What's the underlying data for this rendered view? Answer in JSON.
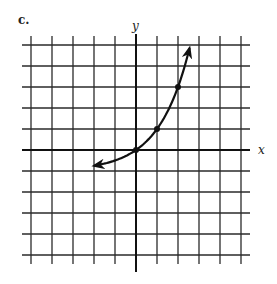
{
  "figure": {
    "part_label": "c.",
    "x_axis_label": "x",
    "y_axis_label": "y",
    "grid": {
      "x_min": -5,
      "x_max": 5,
      "y_min": -5,
      "y_max": 5,
      "step": 1
    },
    "colors": {
      "ink": "#111111",
      "background": "#ffffff"
    }
  },
  "chart_data": {
    "type": "line",
    "title": "c.",
    "xlabel": "x",
    "ylabel": "y",
    "xlim": [
      -5,
      5
    ],
    "ylim": [
      -5,
      5
    ],
    "grid": true,
    "series": [
      {
        "name": "curve (y = 2^x - 1)",
        "x": [
          -2,
          -1,
          0,
          1,
          2,
          2.55
        ],
        "y": [
          -0.75,
          -0.5,
          0,
          1,
          3,
          4.86
        ],
        "arrows": "both_ends"
      }
    ],
    "marked_points": [
      {
        "x": 0,
        "y": 0
      },
      {
        "x": 1,
        "y": 1
      },
      {
        "x": 2,
        "y": 3
      }
    ]
  }
}
